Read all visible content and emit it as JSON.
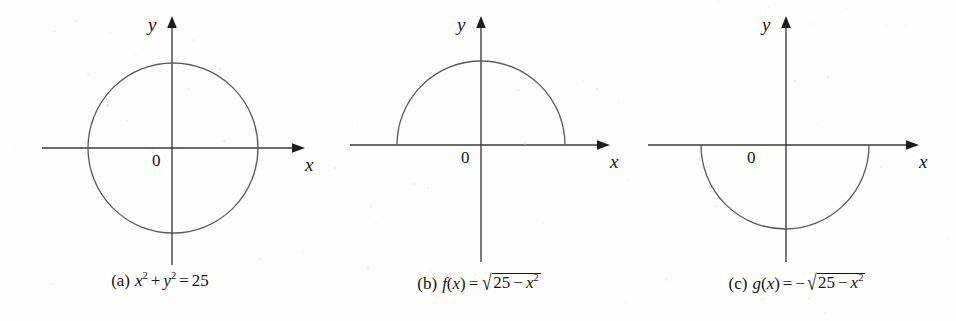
{
  "figure": {
    "name": "circle-and-semicircle-graphs",
    "background_color": "#fdfdfc",
    "ink_color": "#3a3a3a",
    "curve_color": "#5a5a5a",
    "panel_count": 3
  },
  "chart_data": {
    "type": "line",
    "title": "",
    "panels": [
      {
        "id": "a",
        "caption_tag": "(a)",
        "caption_plain": "x² + y² = 25",
        "equation": {
          "lhs_first_var": "x",
          "lhs_first_exp": "2",
          "plus": "+",
          "lhs_second_var": "y",
          "lhs_second_exp": "2",
          "equals": "=",
          "rhs": "25"
        },
        "curve": "full-circle",
        "center": [
          0,
          0
        ],
        "radius": 5,
        "x_domain": [
          -5,
          5
        ],
        "y_range": [
          -5,
          5
        ],
        "axis_labels": {
          "x": "x",
          "y": "y"
        },
        "origin_label": "0",
        "grid": false
      },
      {
        "id": "b",
        "caption_tag": "(b)",
        "caption_plain": "f(x) = √(25 − x²)",
        "equation": {
          "func_name": "f",
          "arg": "x",
          "equals": "=",
          "leading_sign": "",
          "radicand_num": "25",
          "minus": "−",
          "radicand_var": "x",
          "radicand_exp": "2"
        },
        "curve": "upper-semicircle",
        "center": [
          0,
          0
        ],
        "radius": 5,
        "x_domain": [
          -5,
          5
        ],
        "y_range": [
          0,
          5
        ],
        "axis_labels": {
          "x": "x",
          "y": "y"
        },
        "origin_label": "0",
        "grid": false
      },
      {
        "id": "c",
        "caption_tag": "(c)",
        "caption_plain": "g(x) = −√(25 − x²)",
        "equation": {
          "func_name": "g",
          "arg": "x",
          "equals": "=",
          "leading_sign": "−",
          "radicand_num": "25",
          "minus": "−",
          "radicand_var": "x",
          "radicand_exp": "2"
        },
        "curve": "lower-semicircle",
        "center": [
          0,
          0
        ],
        "radius": 5,
        "x_domain": [
          -5,
          5
        ],
        "y_range": [
          -5,
          0
        ],
        "axis_labels": {
          "x": "x",
          "y": "y"
        },
        "origin_label": "0",
        "grid": false
      }
    ]
  }
}
